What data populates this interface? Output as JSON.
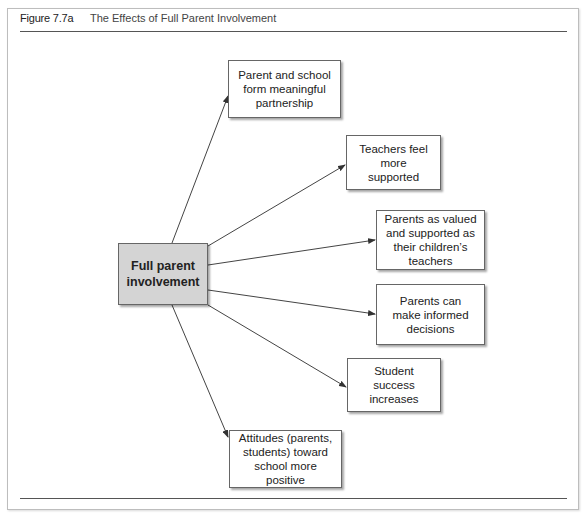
{
  "figure": {
    "number": "Figure 7.7a",
    "title": "The Effects of Full Parent Involvement"
  },
  "diagram": {
    "center": {
      "label": "Full parent involvement",
      "fill": "#d4d4d4"
    },
    "effects": [
      {
        "label": "Parent and school form meaningful partnership"
      },
      {
        "label": "Teachers feel more supported"
      },
      {
        "label": "Parents as valued and supported as their children’s teachers"
      },
      {
        "label": "Parents can make informed decisions"
      },
      {
        "label": "Student success increases"
      },
      {
        "label": "Attitudes (parents, students) toward school more positive"
      }
    ]
  }
}
